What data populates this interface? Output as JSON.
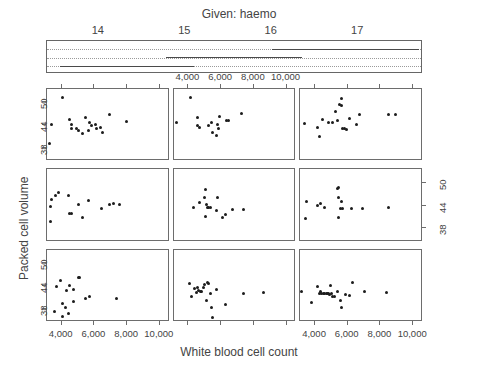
{
  "given": {
    "title": "Given: haemo",
    "tick_labels": [
      "14",
      "15",
      "16",
      "17"
    ],
    "tick_values": [
      14,
      15,
      16,
      17
    ],
    "axis_min": 13.4,
    "axis_max": 17.75,
    "intervals": [
      {
        "row": 2,
        "from": 13.55,
        "to": 14.55
      },
      {
        "row": 2,
        "from": 14.3,
        "to": 14.95
      },
      {
        "row": 2,
        "from": 14.62,
        "to": 15.1
      },
      {
        "row": 1,
        "from": 14.78,
        "to": 15.22
      },
      {
        "row": 1,
        "from": 15.02,
        "to": 15.38
      },
      {
        "row": 1,
        "from": 15.25,
        "to": 15.6
      },
      {
        "row": 1,
        "from": 15.45,
        "to": 16.35
      },
      {
        "row": 0,
        "from": 16.0,
        "to": 16.55
      },
      {
        "row": 0,
        "from": 16.28,
        "to": 17.7
      }
    ]
  },
  "x_axis": {
    "label": "White blood cell count",
    "tick_labels": [
      "4,000",
      "6,000",
      "8,000",
      "10,000"
    ],
    "tick_values": [
      4000,
      6000,
      8000,
      10000
    ],
    "min": 3100,
    "max": 10600
  },
  "y_axis": {
    "label": "Packed cell volume",
    "tick_labels": [
      "38",
      "44",
      "50"
    ],
    "tick_values": [
      38,
      44,
      50
    ],
    "min": 34.5,
    "max": 53.5
  },
  "colors": {
    "point": "#1c1c1c",
    "frame": "#6d6d6d",
    "text": "#444444",
    "dotted_rule": "#9a9a9a",
    "background": "#ffffff"
  },
  "chart_data": {
    "type": "scatter",
    "title": "Given: haemo",
    "xlabel": "White blood cell count",
    "ylabel": "Packed cell volume",
    "xlim": [
      3100,
      10600
    ],
    "ylim": [
      34.5,
      53.5
    ],
    "grid": false,
    "legend": "none",
    "conditioning_variable": "haemo",
    "layout": {
      "rows": 3,
      "cols": 3,
      "panel_order": "bottom-left-to-top-right"
    },
    "panels": [
      {
        "row": 0,
        "col": 0,
        "panel_index": 6,
        "points": [
          [
            3350,
            44.2
          ],
          [
            3280,
            39.3
          ],
          [
            4050,
            51.3
          ],
          [
            4450,
            45.6
          ],
          [
            4620,
            44.3
          ],
          [
            4600,
            43.2
          ],
          [
            4900,
            43.0
          ],
          [
            5000,
            42.6
          ],
          [
            5250,
            41.9
          ],
          [
            5450,
            46.0
          ],
          [
            5700,
            44.7
          ],
          [
            5800,
            43.8
          ],
          [
            5650,
            42.5
          ],
          [
            6050,
            44.2
          ],
          [
            6150,
            43.1
          ],
          [
            6400,
            43.4
          ],
          [
            6500,
            42.2
          ],
          [
            6900,
            46.9
          ],
          [
            7950,
            44.9
          ]
        ]
      },
      {
        "row": 0,
        "col": 1,
        "panel_index": 7,
        "points": [
          [
            3300,
            44.6
          ],
          [
            4100,
            51.3
          ],
          [
            4550,
            46.1
          ],
          [
            4700,
            43.3
          ],
          [
            5250,
            43.9
          ],
          [
            5400,
            44.7
          ],
          [
            5500,
            42.2
          ],
          [
            5750,
            41.4
          ],
          [
            5800,
            44.3
          ],
          [
            5850,
            43.2
          ],
          [
            5900,
            46.2
          ],
          [
            6350,
            45.2
          ],
          [
            6450,
            45.2
          ],
          [
            7250,
            47.1
          ],
          [
            4560,
            43.9
          ]
        ]
      },
      {
        "row": 0,
        "col": 2,
        "panel_index": 8,
        "points": [
          [
            3350,
            44.4
          ],
          [
            4150,
            43.3
          ],
          [
            4300,
            41.0
          ],
          [
            4450,
            45.6
          ],
          [
            4850,
            44.8
          ],
          [
            5050,
            44.8
          ],
          [
            5250,
            47.5
          ],
          [
            5400,
            45.1
          ],
          [
            5500,
            49.5
          ],
          [
            5600,
            51.1
          ],
          [
            5600,
            49.2
          ],
          [
            5700,
            43.0
          ],
          [
            5780,
            43.0
          ],
          [
            5950,
            42.8
          ],
          [
            6100,
            45.8
          ],
          [
            6550,
            44.1
          ],
          [
            6700,
            46.8
          ],
          [
            8500,
            46.7
          ],
          [
            8900,
            46.7
          ]
        ]
      },
      {
        "row": 1,
        "col": 0,
        "panel_index": 3,
        "points": [
          [
            3300,
            43.8
          ],
          [
            3350,
            45.6
          ],
          [
            3300,
            39.9
          ],
          [
            3650,
            46.6
          ],
          [
            3800,
            47.4
          ],
          [
            4400,
            46.5
          ],
          [
            4500,
            41.9
          ],
          [
            4600,
            41.8
          ],
          [
            5050,
            44.3
          ],
          [
            5300,
            40.9
          ],
          [
            5650,
            45.2
          ],
          [
            6450,
            43.1
          ],
          [
            6900,
            44.3
          ],
          [
            7150,
            44.4
          ],
          [
            7550,
            44.3
          ]
        ]
      },
      {
        "row": 1,
        "col": 1,
        "panel_index": 4,
        "points": [
          [
            4300,
            43.6
          ],
          [
            4650,
            44.9
          ],
          [
            5000,
            46.0
          ],
          [
            5050,
            48.3
          ],
          [
            5100,
            44.2
          ],
          [
            5150,
            43.6
          ],
          [
            5250,
            43.5
          ],
          [
            5350,
            43.5
          ],
          [
            5050,
            41.0
          ],
          [
            5800,
            46.1
          ],
          [
            5700,
            42.8
          ],
          [
            6100,
            40.9
          ],
          [
            6250,
            41.6
          ],
          [
            6700,
            43.0
          ],
          [
            7400,
            43.0
          ]
        ]
      },
      {
        "row": 1,
        "col": 2,
        "panel_index": 5,
        "points": [
          [
            3450,
            45.0
          ],
          [
            3400,
            40.7
          ],
          [
            4150,
            44.0
          ],
          [
            4350,
            44.6
          ],
          [
            4550,
            43.4
          ],
          [
            5350,
            48.5
          ],
          [
            5450,
            48.6
          ],
          [
            5450,
            46.2
          ],
          [
            5600,
            45.1
          ],
          [
            5550,
            43.3
          ],
          [
            5650,
            43.2
          ],
          [
            5450,
            40.8
          ],
          [
            6200,
            43.3
          ],
          [
            6900,
            43.2
          ],
          [
            8500,
            43.4
          ]
        ]
      },
      {
        "row": 2,
        "col": 0,
        "panel_index": 0,
        "points": [
          [
            3550,
            37.3
          ],
          [
            3900,
            45.5
          ],
          [
            3700,
            43.8
          ],
          [
            4050,
            39.3
          ],
          [
            4050,
            35.9
          ],
          [
            4300,
            42.9
          ],
          [
            4250,
            38.3
          ],
          [
            4400,
            36.6
          ],
          [
            4500,
            44.0
          ],
          [
            4700,
            43.0
          ],
          [
            4750,
            39.9
          ],
          [
            5000,
            46.1
          ],
          [
            5100,
            46.2
          ],
          [
            5450,
            40.6
          ],
          [
            5700,
            41.1
          ],
          [
            7350,
            40.7
          ]
        ]
      },
      {
        "row": 2,
        "col": 1,
        "panel_index": 1,
        "points": [
          [
            4050,
            44.5
          ],
          [
            4200,
            41.2
          ],
          [
            4350,
            43.3
          ],
          [
            4500,
            42.3
          ],
          [
            4550,
            43.6
          ],
          [
            4600,
            42.7
          ],
          [
            4750,
            42.5
          ],
          [
            4800,
            42.5
          ],
          [
            4900,
            43.5
          ],
          [
            5000,
            44.3
          ],
          [
            5100,
            40.2
          ],
          [
            5150,
            45.0
          ],
          [
            5250,
            44.6
          ],
          [
            5350,
            42.0
          ],
          [
            5400,
            38.3
          ],
          [
            5450,
            35.6
          ],
          [
            5750,
            43.0
          ],
          [
            6300,
            39.2
          ],
          [
            7400,
            42.0
          ],
          [
            8600,
            42.3
          ]
        ]
      },
      {
        "row": 2,
        "col": 2,
        "panel_index": 2,
        "points": [
          [
            3150,
            42.4
          ],
          [
            3800,
            39.6
          ],
          [
            4150,
            43.9
          ],
          [
            4250,
            41.9
          ],
          [
            4350,
            42.6
          ],
          [
            4400,
            41.9
          ],
          [
            4500,
            42.0
          ],
          [
            4600,
            42.0
          ],
          [
            4700,
            42.1
          ],
          [
            4750,
            42.0
          ],
          [
            4800,
            42.1
          ],
          [
            4900,
            41.8
          ],
          [
            4950,
            44.0
          ],
          [
            5000,
            42.1
          ],
          [
            5050,
            41.2
          ],
          [
            5200,
            41.2
          ],
          [
            5400,
            42.4
          ],
          [
            5550,
            40.2
          ],
          [
            5600,
            38.4
          ],
          [
            5850,
            41.6
          ],
          [
            6100,
            41.4
          ],
          [
            6300,
            45.0
          ],
          [
            7000,
            42.6
          ],
          [
            8350,
            42.2
          ]
        ]
      }
    ]
  }
}
